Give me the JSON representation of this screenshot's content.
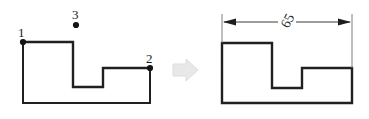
{
  "diagram": {
    "background_color": "#ffffff",
    "line_color": "#231f20",
    "dimension_line_color": "#3a3a3a",
    "arrow_fill_color": "#e8e8e8",
    "arrow_stroke_color": "#dddddd",
    "dot_color": "#141414",
    "left_figure": {
      "name": "open-polyline-with-vertex-labels",
      "polyline_points": "23,42 73,42 73,87 103,87 103,68 150,68",
      "left_wall_points": "23,42 23,103 150,103 150,68",
      "vertex_labels": [
        {
          "text": "1",
          "x": 18,
          "y": 26,
          "dot_x": 23,
          "dot_y": 42
        },
        {
          "text": "2",
          "x": 146,
          "y": 52,
          "dot_x": 150,
          "dot_y": 68
        },
        {
          "text": "3",
          "x": 72,
          "y": 8,
          "dot_x": 76,
          "dot_y": 25
        }
      ]
    },
    "transition_arrow": {
      "name": "rightward-transition-arrow",
      "points": "173,64 186,64 186,59 198,70 186,81 186,76 173,76"
    },
    "right_figure": {
      "name": "closed-polygon-with-dimension",
      "polygon_points": "222,43 272,43 272,88 302,88 302,68 352,68 352,103 222,103",
      "dimension": {
        "label": "65",
        "label_x": 281,
        "label_y": 14,
        "line_y": 22,
        "left_x": 222,
        "right_x": 352,
        "extension_left": {
          "x": 222,
          "y1": 14,
          "y2": 43
        },
        "extension_right": {
          "x": 352,
          "y1": 14,
          "y2": 68
        }
      }
    }
  }
}
